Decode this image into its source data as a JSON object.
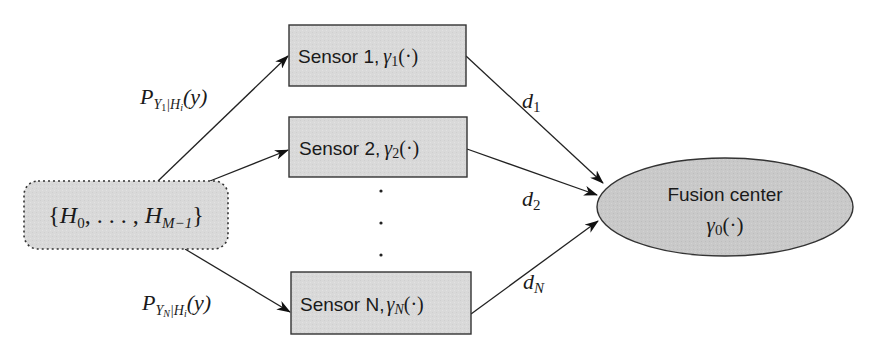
{
  "diagram": {
    "type": "distributed-detection-block-diagram",
    "colors": {
      "node_fill": "#d9d9d9",
      "node_stroke": "#333333",
      "edge": "#222222",
      "text": "#1a1a1a",
      "background": "#ffffff"
    },
    "source": {
      "label": "{H_0, ..., H_{M-1}}",
      "parts": {
        "open": "{",
        "h0": "H",
        "h0_sub": "0",
        "mid": ", . . . , ",
        "hm": "H",
        "hm_sub": "M−1",
        "close": "}"
      },
      "shape": "rounded-rectangle-dotted"
    },
    "sensors": [
      {
        "name": "Sensor 1",
        "label": "Sensor 1,",
        "func": "γ",
        "func_sub": "1",
        "args": "(·)"
      },
      {
        "name": "Sensor 2",
        "label": "Sensor 2,",
        "func": "γ",
        "func_sub": "2",
        "args": "(·)"
      },
      {
        "name": "Sensor N",
        "label": "Sensor N,",
        "func": "γ",
        "func_sub": "N",
        "args": "(·)"
      }
    ],
    "ellipsis": "⋮",
    "fusion_center": {
      "label": "Fusion center",
      "func": "γ",
      "func_sub": "0",
      "args": "(·)"
    },
    "edge_labels": {
      "p1": {
        "P": "P",
        "sub": "Y",
        "sub_sub": "1",
        "bar": "|H",
        "bar_sub": "i",
        "arg": "(y)"
      },
      "pN": {
        "P": "P",
        "sub": "Y",
        "sub_sub": "N",
        "bar": "|H",
        "bar_sub": "i",
        "arg": "(y)"
      },
      "d1": {
        "d": "d",
        "sub": "1"
      },
      "d2": {
        "d": "d",
        "sub": "2"
      },
      "dN": {
        "d": "d",
        "sub": "N"
      }
    }
  }
}
